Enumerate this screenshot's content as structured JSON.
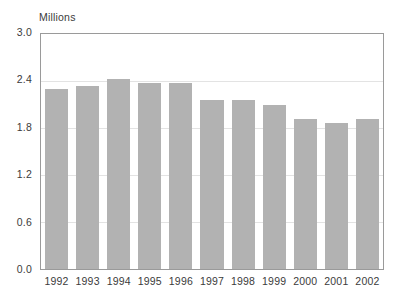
{
  "chart_data": {
    "type": "bar",
    "title": "",
    "subtitle": "",
    "xlabel": "",
    "ylabel": "Millions",
    "categories": [
      "1992",
      "1993",
      "1994",
      "1995",
      "1996",
      "1997",
      "1998",
      "1999",
      "2000",
      "2001",
      "2002"
    ],
    "values": [
      2.3,
      2.33,
      2.43,
      2.37,
      2.37,
      2.16,
      2.16,
      2.1,
      1.92,
      1.86,
      1.92
    ],
    "ylim": [
      0.0,
      3.0
    ],
    "ytick_labels": [
      "0.0",
      "0.6",
      "1.2",
      "1.8",
      "2.4",
      "3.0"
    ],
    "ytick_values": [
      0.0,
      0.6,
      1.2,
      1.8,
      2.4,
      3.0
    ],
    "grid": true,
    "grid_axis": "y",
    "legend": false,
    "legend_position": "none",
    "bar_color": "#b2b2b2",
    "frame_color": "#9a9a9a",
    "gridline_color": "#e3e3e3",
    "text_color": "#3b3b3b",
    "background_color": "#ffffff",
    "annotations": []
  }
}
